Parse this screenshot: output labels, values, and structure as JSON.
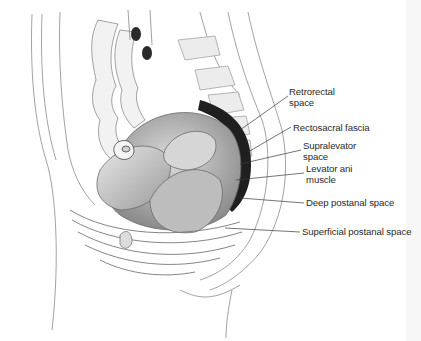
{
  "figure": {
    "labels": [
      {
        "id": "retrorectal-space",
        "lines": [
          "Retrorectal",
          "space"
        ],
        "x": 289,
        "y": 86
      },
      {
        "id": "rectosacral-fascia",
        "lines": [
          "Rectosacral fascia"
        ],
        "x": 293,
        "y": 122
      },
      {
        "id": "supralevator-space",
        "lines": [
          "Supralevator",
          "space"
        ],
        "x": 303,
        "y": 140
      },
      {
        "id": "levator-ani-muscle",
        "lines": [
          "Levator ani",
          "muscle"
        ],
        "x": 306,
        "y": 163
      },
      {
        "id": "deep-postanal-space",
        "lines": [
          "Deep postanal space"
        ],
        "x": 306,
        "y": 197
      },
      {
        "id": "superficial-postanal-space",
        "lines": [
          "Superficial postanal space"
        ],
        "x": 302,
        "y": 226
      }
    ],
    "leader_color": "#3a3a3a"
  }
}
